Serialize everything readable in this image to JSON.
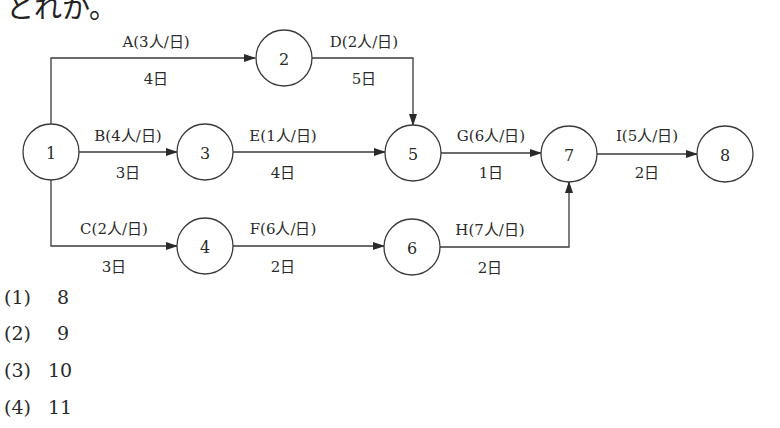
{
  "header": {
    "text": "とれか。"
  },
  "diagram": {
    "nodes": [
      {
        "id": "1",
        "label": "1",
        "cx": 51,
        "cy": 152
      },
      {
        "id": "2",
        "label": "2",
        "cx": 284,
        "cy": 58
      },
      {
        "id": "3",
        "label": "3",
        "cx": 205,
        "cy": 152
      },
      {
        "id": "4",
        "label": "4",
        "cx": 205,
        "cy": 246
      },
      {
        "id": "5",
        "label": "5",
        "cx": 413,
        "cy": 153
      },
      {
        "id": "6",
        "label": "6",
        "cx": 412,
        "cy": 247
      },
      {
        "id": "7",
        "label": "7",
        "cx": 569,
        "cy": 154
      },
      {
        "id": "8",
        "label": "8",
        "cx": 725,
        "cy": 154
      }
    ],
    "activities": [
      {
        "id": "A",
        "label": "A(3人/日)",
        "duration": "4日",
        "from": "1",
        "to": "2"
      },
      {
        "id": "B",
        "label": "B(4人/日)",
        "duration": "3日",
        "from": "1",
        "to": "3"
      },
      {
        "id": "C",
        "label": "C(2人/日)",
        "duration": "3日",
        "from": "1",
        "to": "4"
      },
      {
        "id": "D",
        "label": "D(2人/日)",
        "duration": "5日",
        "from": "2",
        "to": "5"
      },
      {
        "id": "E",
        "label": "E(1人/日)",
        "duration": "4日",
        "from": "3",
        "to": "5"
      },
      {
        "id": "F",
        "label": "F(6人/日)",
        "duration": "2日",
        "from": "4",
        "to": "6"
      },
      {
        "id": "G",
        "label": "G(6人/日)",
        "duration": "1日",
        "from": "5",
        "to": "7"
      },
      {
        "id": "H",
        "label": "H(7人/日)",
        "duration": "2日",
        "from": "6",
        "to": "7"
      },
      {
        "id": "I",
        "label": "I(5人/日)",
        "duration": "2日",
        "from": "7",
        "to": "8"
      }
    ]
  },
  "choices": [
    {
      "num": "(1)",
      "value": "8"
    },
    {
      "num": "(2)",
      "value": "9"
    },
    {
      "num": "(3)",
      "value": "10"
    },
    {
      "num": "(4)",
      "value": "11"
    }
  ]
}
